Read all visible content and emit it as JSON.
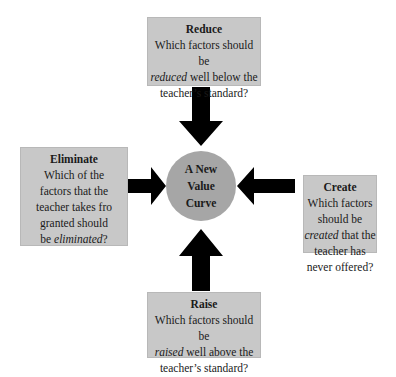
{
  "center": {
    "lines": [
      "A New",
      "Value",
      "Curve"
    ]
  },
  "boxes": {
    "reduce": {
      "title": "Reduce",
      "pre": "Which factors should be",
      "emph": "reduced",
      "post": " well below the",
      "last": "teacher’s standard?"
    },
    "eliminate": {
      "title": "Eliminate",
      "lines": [
        "Which of the",
        "factors that the",
        "teacher takes fro",
        "granted should"
      ],
      "pre_last": "be ",
      "emph": "eliminated",
      "post_last": "?"
    },
    "create": {
      "title": "Create",
      "lines": [
        "Which factors",
        "should be"
      ],
      "emph": "created",
      "post": " that the",
      "lines2": [
        "teacher has",
        "never offered?"
      ]
    },
    "raise": {
      "title": "Raise",
      "pre": "Which factors should be",
      "emph": "raised",
      "post": " well above the",
      "last": "teacher’s standard?"
    }
  },
  "colors": {
    "box_fill": "#c8c8c8",
    "circle_fill": "#a6a6a6",
    "arrow": "#000000"
  }
}
